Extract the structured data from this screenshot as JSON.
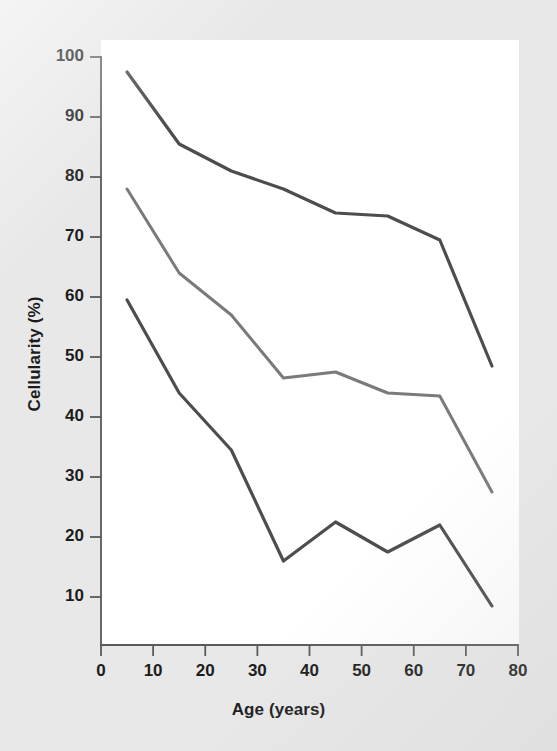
{
  "figure": {
    "background_color": "#e8e8e8",
    "plot_background_color": "#ffffff",
    "axis_color": "#5a5a5a"
  },
  "chart_data": {
    "type": "line",
    "title": "",
    "subtitle": "",
    "xlabel": "Age (years)",
    "ylabel": "Cellularity (%)",
    "xlim": [
      0,
      80
    ],
    "ylim": [
      0,
      100
    ],
    "xticks": [
      0,
      10,
      20,
      30,
      40,
      50,
      60,
      70,
      80
    ],
    "yticks": [
      10,
      20,
      30,
      40,
      50,
      60,
      70,
      80,
      90,
      100
    ],
    "xtick_labels": [
      "0",
      "10",
      "20",
      "30",
      "40",
      "50",
      "60",
      "70",
      "80"
    ],
    "ytick_labels": [
      "10",
      "20",
      "30",
      "40",
      "50",
      "60",
      "70",
      "80",
      "90",
      "100"
    ],
    "grid": false,
    "legend": false,
    "legend_position": "none",
    "x": [
      5,
      15,
      25,
      35,
      45,
      55,
      65,
      75
    ],
    "series": [
      {
        "name": "upper",
        "color": "#4d4d4d",
        "line_width": 3.2,
        "values": [
          97.5,
          85.5,
          81.0,
          78.0,
          74.0,
          73.5,
          69.5,
          48.5
        ]
      },
      {
        "name": "middle",
        "color": "#7a7a7a",
        "line_width": 3.0,
        "values": [
          78.0,
          64.0,
          57.0,
          46.5,
          47.5,
          44.0,
          43.5,
          27.5
        ]
      },
      {
        "name": "lower",
        "color": "#4d4d4d",
        "line_width": 3.2,
        "values": [
          59.5,
          44.0,
          34.5,
          16.0,
          22.5,
          17.5,
          22.0,
          8.5
        ]
      }
    ]
  }
}
